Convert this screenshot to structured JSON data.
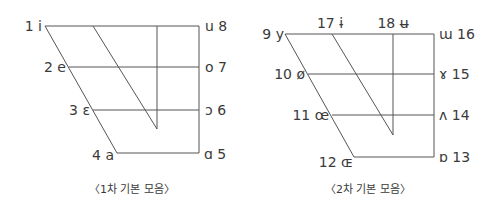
{
  "diagrams": [
    {
      "caption": "〈1차 기본 모음〉",
      "vowels": [
        {
          "num": "1",
          "symbol": "i",
          "label": "1 i"
        },
        {
          "num": "2",
          "symbol": "e",
          "label": "2 e"
        },
        {
          "num": "3",
          "symbol": "ɛ",
          "label": "3 ɛ"
        },
        {
          "num": "4",
          "symbol": "a",
          "label": "4 a"
        },
        {
          "num": "5",
          "symbol": "ɑ",
          "label": "ɑ 5"
        },
        {
          "num": "6",
          "symbol": "ɔ",
          "label": "ɔ 6"
        },
        {
          "num": "7",
          "symbol": "o",
          "label": "o 7"
        },
        {
          "num": "8",
          "symbol": "u",
          "label": "u 8"
        }
      ]
    },
    {
      "caption": "〈2차 기본 모음〉",
      "vowels": [
        {
          "num": "9",
          "symbol": "y",
          "label": "9 y"
        },
        {
          "num": "10",
          "symbol": "ø",
          "label": "10 ø"
        },
        {
          "num": "11",
          "symbol": "œ",
          "label": "11 œ"
        },
        {
          "num": "12",
          "symbol": "ɶ",
          "label": "12 ɶ"
        },
        {
          "num": "13",
          "symbol": "ɒ",
          "label": "ɒ 13"
        },
        {
          "num": "14",
          "symbol": "ʌ",
          "label": "ʌ 14"
        },
        {
          "num": "15",
          "symbol": "ɤ",
          "label": "ɤ 15"
        },
        {
          "num": "16",
          "symbol": "ɯ",
          "label": "ɯ 16"
        },
        {
          "num": "17",
          "symbol": "ɨ",
          "label": "17 ɨ"
        },
        {
          "num": "18",
          "symbol": "ʉ",
          "label": "18 ʉ"
        }
      ]
    }
  ]
}
